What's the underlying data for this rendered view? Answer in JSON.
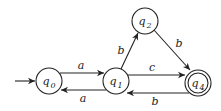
{
  "diagram": {
    "type": "finite-automaton",
    "colors": {
      "stroke": "#222222",
      "background": "#ffffff"
    },
    "states": [
      {
        "id": "q0",
        "label": "q",
        "sub": "0",
        "x": 49,
        "y": 81,
        "r": 13,
        "start": true,
        "accepting": false
      },
      {
        "id": "q1",
        "label": "q",
        "sub": "1",
        "x": 116,
        "y": 81,
        "r": 13,
        "start": false,
        "accepting": false
      },
      {
        "id": "q2",
        "label": "q",
        "sub": "2",
        "x": 145,
        "y": 21,
        "r": 13,
        "start": false,
        "accepting": false
      },
      {
        "id": "q4",
        "label": "q",
        "sub": "4",
        "x": 198,
        "y": 83,
        "r": 13,
        "start": false,
        "accepting": true
      }
    ],
    "transitions": [
      {
        "from": "q0",
        "to": "q1",
        "symbol": "a"
      },
      {
        "from": "q1",
        "to": "q0",
        "symbol": "a"
      },
      {
        "from": "q1",
        "to": "q2",
        "symbol": "b"
      },
      {
        "from": "q2",
        "to": "q4",
        "symbol": "b"
      },
      {
        "from": "q1",
        "to": "q4",
        "symbol": "c"
      },
      {
        "from": "q4",
        "to": "q1",
        "symbol": "b"
      }
    ]
  }
}
